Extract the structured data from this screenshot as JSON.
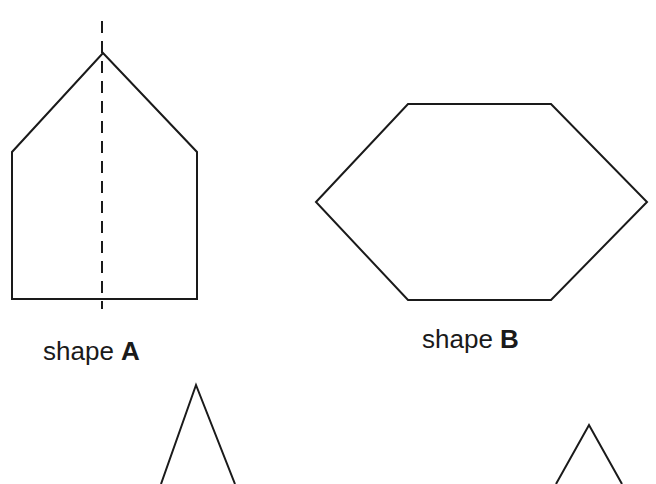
{
  "diagram": {
    "background": "#ffffff",
    "stroke_color": "#1a1a1a",
    "shapes": [
      {
        "id": "A",
        "kind": "pentagon",
        "label_prefix": "shape",
        "label_letter": "A",
        "points": "12,152 103,53 197,152 197,299 12,299",
        "symmetry_line": {
          "x": 102,
          "y1": 21,
          "y2": 309,
          "style": "dashed"
        }
      },
      {
        "id": "B",
        "kind": "hexagon",
        "label_prefix": "shape",
        "label_letter": "B",
        "points": "316,202 408,104 551,104 647,202 551,300 408,300"
      },
      {
        "id": "C",
        "kind": "triangle-partial",
        "points": "161,484 196,385 235,484"
      },
      {
        "id": "D",
        "kind": "triangle-partial",
        "points": "556,484 589,425 622,484"
      }
    ]
  }
}
